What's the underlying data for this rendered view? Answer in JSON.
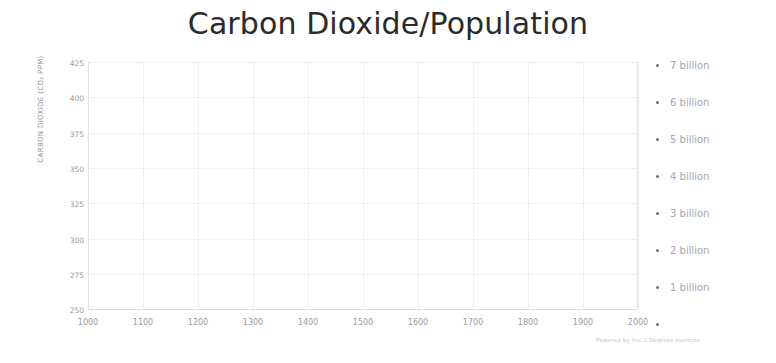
{
  "chart_data": {
    "type": "line",
    "title": "Carbon Dioxide/Population",
    "xlabel": "",
    "ylabel": "CARBON DIOXIDE (CO₂ PPM)",
    "xlim": [
      1000,
      2020
    ],
    "ylim": [
      250,
      425
    ],
    "grid": true,
    "legend_position": "right",
    "attribution": "Powered by the 2 Degrees Institute",
    "x_ticks": [
      "1000",
      "1100",
      "1200",
      "1300",
      "1400",
      "1500",
      "1600",
      "1700",
      "1800",
      "1900",
      "2000"
    ],
    "y_ticks": [
      "425",
      "400",
      "375",
      "350",
      "325",
      "300",
      "275",
      "250"
    ],
    "right_axis": {
      "label": "Population",
      "unit": "billion",
      "ticks": [
        "7 billion",
        "6 billion",
        "5 billion",
        "4 billion",
        "3 billion",
        "2 billion",
        "1 billion",
        ""
      ],
      "values": [
        7,
        6,
        5,
        4,
        3,
        2,
        1,
        0
      ],
      "range": [
        0,
        7.5
      ]
    },
    "colors": {
      "co2_line": "#6e6e73",
      "population_line": "#c9c9cd",
      "population_fill": "#e2e2e4",
      "grid": "#f0f0f1",
      "tick_text": "#9a9a9e",
      "title": "#2b2b2b"
    },
    "series": [
      {
        "name": "Carbon Dioxide (CO2 PPM)",
        "axis": "left",
        "color": "#6e6e73",
        "x": [
          1000,
          1050,
          1100,
          1150,
          1200,
          1250,
          1300,
          1350,
          1400,
          1450,
          1500,
          1550,
          1600,
          1650,
          1700,
          1750,
          1800,
          1850,
          1875,
          1900,
          1920,
          1940,
          1950,
          1960,
          1970,
          1980,
          1990,
          2000,
          2010,
          2020
        ],
        "y": [
          279,
          280,
          281,
          282,
          283,
          283,
          282,
          282,
          281,
          282,
          282,
          282,
          277,
          278,
          278,
          279,
          282,
          285,
          288,
          296,
          303,
          311,
          313,
          317,
          326,
          339,
          354,
          369,
          389,
          412
        ]
      },
      {
        "name": "Population",
        "axis": "right",
        "color": "#c9c9cd",
        "x": [
          1000,
          1100,
          1200,
          1300,
          1400,
          1500,
          1600,
          1700,
          1750,
          1800,
          1850,
          1900,
          1927,
          1950,
          1960,
          1974,
          1987,
          1999,
          2011,
          2020
        ],
        "y": [
          0.31,
          0.35,
          0.39,
          0.39,
          0.35,
          0.46,
          0.55,
          0.6,
          0.79,
          0.98,
          1.26,
          1.65,
          2.0,
          2.52,
          3.02,
          4.0,
          5.0,
          6.0,
          7.0,
          7.75
        ]
      }
    ]
  }
}
